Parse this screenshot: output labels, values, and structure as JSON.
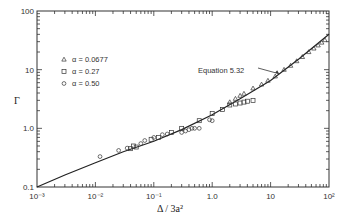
{
  "chart_data": {
    "type": "scatter",
    "title": "",
    "xlabel": "Δ / 3a²",
    "ylabel": "Γ",
    "xscale": "log",
    "yscale": "log",
    "xlim": [
      0.001,
      100
    ],
    "ylim": [
      0.1,
      100
    ],
    "x_tick_labels": [
      "10⁻³",
      "10⁻²",
      "10⁻¹",
      "1.0",
      "10",
      "10²"
    ],
    "y_tick_labels": [
      "0.1",
      "1.0",
      "10",
      "100"
    ],
    "grid": false,
    "legend_position": "upper-left (inside)",
    "legend": [
      {
        "marker": "triangle",
        "label": "α = 0.0677"
      },
      {
        "marker": "square",
        "label": "α = 0.27"
      },
      {
        "marker": "circle",
        "label": "α = 0.50"
      }
    ],
    "annotations": [
      {
        "text": "Equation 5.32",
        "arrow_to": [
          14,
          8.5
        ]
      }
    ],
    "series": [
      {
        "name": "Equation 5.32",
        "kind": "line",
        "x": [
          0.001,
          0.003,
          0.01,
          0.03,
          0.1,
          0.3,
          1,
          3,
          10,
          30,
          100
        ],
        "y": [
          0.1,
          0.16,
          0.26,
          0.4,
          0.6,
          0.95,
          1.7,
          3.2,
          6.5,
          15,
          40
        ]
      },
      {
        "name": "α = 0.0677",
        "marker": "triangle",
        "x": [
          2.0,
          2.5,
          3.0,
          3.5,
          5,
          7,
          9,
          12,
          17,
          22,
          28,
          35,
          45,
          55,
          65,
          75,
          85
        ],
        "y": [
          2.8,
          3.2,
          3.6,
          3.9,
          4.8,
          5.6,
          6.5,
          7.7,
          10,
          11.7,
          14,
          16.5,
          20,
          23,
          26,
          29,
          32
        ]
      },
      {
        "name": "α = 0.27",
        "marker": "square",
        "x": [
          0.04,
          0.045,
          0.05,
          0.09,
          0.12,
          0.2,
          0.3,
          0.6,
          1.0,
          1.5,
          2.0,
          2.5,
          3.0,
          3.5,
          4.0,
          5.0
        ],
        "y": [
          0.45,
          0.5,
          0.48,
          0.65,
          0.7,
          0.85,
          1.0,
          1.35,
          1.8,
          2.1,
          2.5,
          2.6,
          2.7,
          2.8,
          2.9,
          3.0
        ]
      },
      {
        "name": "α = 0.50",
        "marker": "circle",
        "x": [
          0.012,
          0.025,
          0.035,
          0.06,
          0.07,
          0.1,
          0.14,
          0.17,
          0.3,
          0.35,
          0.4,
          0.45,
          0.5,
          0.6,
          0.9,
          1.0
        ],
        "y": [
          0.33,
          0.42,
          0.46,
          0.55,
          0.62,
          0.7,
          0.78,
          0.8,
          0.85,
          0.9,
          0.95,
          1.0,
          1.0,
          1.0,
          1.4,
          1.35
        ]
      }
    ]
  }
}
